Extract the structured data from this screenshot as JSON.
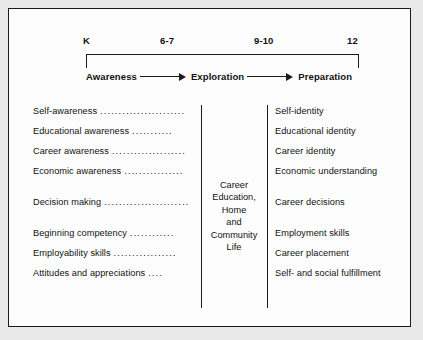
{
  "timeline": {
    "grades": [
      "K",
      "6-7",
      "9-10",
      "12"
    ],
    "stages": [
      "Awareness",
      "Exploration",
      "Preparation"
    ],
    "arrow_icon": "right-arrow-icon"
  },
  "center": {
    "lines": [
      "Career",
      "Education,",
      "Home",
      "and",
      "Community",
      "Life"
    ]
  },
  "columns": {
    "left_groups": [
      {
        "rows": [
          {
            "label": "Self-awareness",
            "leader": "......................."
          },
          {
            "label": "Educational awareness",
            "leader": "..........."
          },
          {
            "label": "Career awareness",
            "leader": "...................."
          },
          {
            "label": "Economic awareness",
            "leader": "................"
          }
        ]
      },
      {
        "rows": [
          {
            "label": "Decision making",
            "leader": "......................."
          }
        ]
      },
      {
        "rows": [
          {
            "label": "Beginning competency",
            "leader": "............"
          },
          {
            "label": "Employability skills",
            "leader": "................."
          },
          {
            "label": "Attitudes and appreciations",
            "leader": "...."
          }
        ]
      }
    ],
    "right_groups": [
      {
        "rows": [
          {
            "label": "Self-identity"
          },
          {
            "label": "Educational identity"
          },
          {
            "label": "Career identity"
          },
          {
            "label": "Economic understanding"
          }
        ]
      },
      {
        "rows": [
          {
            "label": "Career decisions"
          }
        ]
      },
      {
        "rows": [
          {
            "label": "Employment skills"
          },
          {
            "label": "Career placement"
          },
          {
            "label": "Self- and social fulfillment"
          }
        ]
      }
    ]
  },
  "colors": {
    "ink": "#1b1b1b",
    "panel_background": "#fdfdfd",
    "page_background": "#e9e9e9"
  }
}
